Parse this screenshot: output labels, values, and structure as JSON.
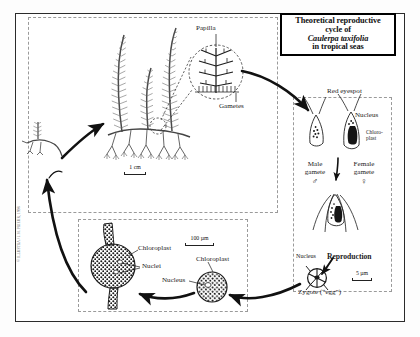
{
  "figure": {
    "title_box": {
      "line1": "Theoretical reproductive",
      "line2": "cycle of",
      "species": "Caulerpa taxifolia",
      "line4": "in tropical seas"
    },
    "credit": "© ILLUSTRA / J.M. PRIEUR, 1998"
  },
  "panels": {
    "thallus": {
      "name": "thallus-panel",
      "labels": {
        "papilla": "Papilla",
        "gametes": "Gametes"
      },
      "scale": {
        "text": "1 cm",
        "length_px": 22
      }
    },
    "gametes": {
      "name": "gametes-panel",
      "labels": {
        "red_eyespot": "Red eyespot",
        "nucleus_top": "Nucleus",
        "chloroplast_line1": "Chloro-",
        "chloroplast_line2": "plast",
        "male_gamete_line1": "Male",
        "male_gamete_line2": "gamete",
        "male_symbol": "♂",
        "female_gamete_line1": "Female",
        "female_gamete_line2": "gamete",
        "female_symbol": "♀",
        "reproduction": "Reproduction",
        "nucleus_zygote": "Nucleus",
        "zygote": "Zygote (“egg”)"
      },
      "scale": {
        "text": "5 µm",
        "length_px": 20
      }
    },
    "cells": {
      "name": "cells-panel",
      "labels": {
        "chloroplast_left": "Chloroplast",
        "nuclei": "Nuclei",
        "chloroplast_right": "Chloroplast",
        "nucleus_right": "Nucleus"
      },
      "scale": {
        "text": "100 µm",
        "length_px": 29
      }
    }
  },
  "colors": {
    "frame": "#2b2b2b",
    "dashed": "#9a9a9a",
    "ink": "#1a1a1a",
    "arrow": "#111111"
  }
}
